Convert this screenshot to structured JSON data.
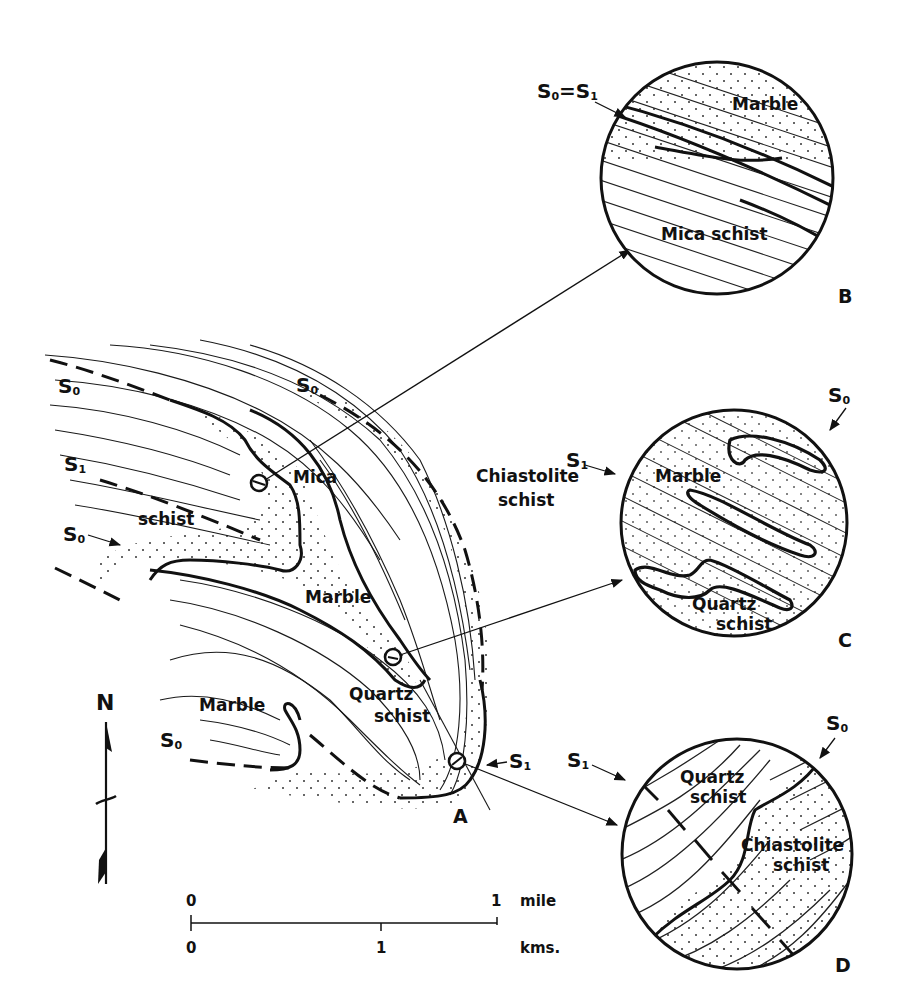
{
  "map_A": {
    "panel_letter": "A",
    "units": {
      "mica_schist_line1": "Mica",
      "mica_schist_line2": "schist",
      "marble_upper": "Marble",
      "marble_lower": "Marble",
      "quartz_schist_line1": "Quartz",
      "quartz_schist_line2": "schist",
      "chiastolite_line1": "Chiastolite",
      "chiastolite_line2": "schist"
    },
    "structure_labels": {
      "s0_top_left": {
        "base": "S",
        "sub": "0"
      },
      "s0_top_center": {
        "base": "S",
        "sub": "0"
      },
      "s1_left": {
        "base": "S",
        "sub": "1"
      },
      "s0_mid_left": {
        "base": "S",
        "sub": "0"
      },
      "s0_bottom_left": {
        "base": "S",
        "sub": "0"
      },
      "s1_axial": {
        "base": "S",
        "sub": "1"
      }
    }
  },
  "inset_B": {
    "panel_letter": "B",
    "label_top": "Marble",
    "label_bottom": "Mica schist",
    "structure_label": {
      "a": "S",
      "a_sub": "0",
      "eq": "=",
      "b": "S",
      "b_sub": "1"
    }
  },
  "inset_C": {
    "panel_letter": "C",
    "label_top": "Marble",
    "label_bottom_line1": "Quartz",
    "label_bottom_line2": "schist",
    "s0": {
      "base": "S",
      "sub": "0"
    },
    "s1": {
      "base": "S",
      "sub": "1"
    }
  },
  "inset_D": {
    "panel_letter": "D",
    "label_left_line1": "Quartz",
    "label_left_line2": "schist",
    "label_right_line1": "Chiastolite",
    "label_right_line2": "schist",
    "s0": {
      "base": "S",
      "sub": "0"
    },
    "s1": {
      "base": "S",
      "sub": "1"
    }
  },
  "north_arrow": {
    "label": "N"
  },
  "scale_bar": {
    "miles_start": "0",
    "miles_end": "1",
    "miles_unit": "mile",
    "km_start": "0",
    "km_mid": "1",
    "km_unit": "kms."
  }
}
